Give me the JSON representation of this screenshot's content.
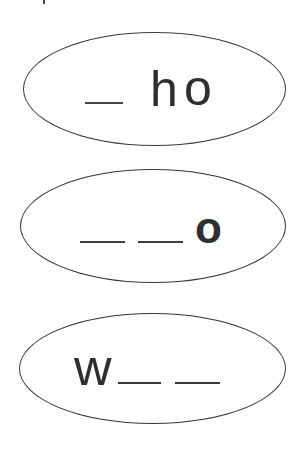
{
  "page": {
    "type": "phonics-worksheet-fragment",
    "background": "#ffffff",
    "ink_color": "#2f2f2f",
    "outline_color": "#3c3c3c"
  },
  "ovals": [
    {
      "name": "oval-1",
      "tokens": [
        {
          "type": "blank"
        },
        {
          "type": "letter",
          "char": "h"
        },
        {
          "type": "letter",
          "char": "o"
        }
      ]
    },
    {
      "name": "oval-2",
      "tokens": [
        {
          "type": "blank"
        },
        {
          "type": "blank"
        },
        {
          "type": "letter",
          "char": "o",
          "weight": "bold"
        }
      ]
    },
    {
      "name": "oval-3",
      "tokens": [
        {
          "type": "letter",
          "char": "w"
        },
        {
          "type": "blank"
        },
        {
          "type": "blank"
        }
      ]
    }
  ]
}
